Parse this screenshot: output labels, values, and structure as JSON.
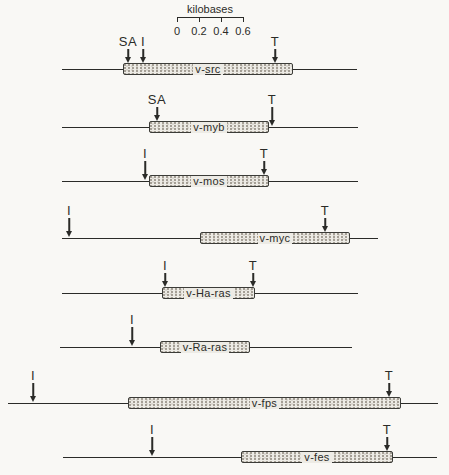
{
  "figure": {
    "colors": {
      "background": "#f9f8f5",
      "ink": "#2b2b28",
      "box_fill": "#edebe5",
      "box_dot": "#a39d93"
    },
    "scale": {
      "title": "kilobases",
      "tick_labels": [
        "0",
        "0.2",
        "0.4",
        "0.6"
      ],
      "x": 177,
      "width": 66,
      "bar_y": 17,
      "title_y": 3,
      "labels_y": 25
    },
    "rows": [
      {
        "label": "v-src",
        "label_parts": {
          "plain": "v-",
          "underlined": "src"
        },
        "line": {
          "x1": 62,
          "x2": 357,
          "y": 69
        },
        "box": {
          "x": 123,
          "w": 170
        },
        "arrows": [
          {
            "label": "SA",
            "x": 128
          },
          {
            "label": "I",
            "x": 143
          },
          {
            "label": "T",
            "x": 275
          }
        ]
      },
      {
        "label": "v-myb",
        "line": {
          "x1": 62,
          "x2": 358,
          "y": 127
        },
        "box": {
          "x": 149,
          "w": 120
        },
        "arrows": [
          {
            "label": "SA",
            "x": 157
          },
          {
            "label": "T",
            "x": 272
          }
        ]
      },
      {
        "label": "v-mos",
        "line": {
          "x1": 62,
          "x2": 358,
          "y": 181
        },
        "box": {
          "x": 149,
          "w": 120
        },
        "arrows": [
          {
            "label": "I",
            "x": 145
          },
          {
            "label": "T",
            "x": 264
          }
        ]
      },
      {
        "label": "v-myc",
        "line": {
          "x1": 62,
          "x2": 378,
          "y": 238
        },
        "box": {
          "x": 200,
          "w": 150
        },
        "arrows": [
          {
            "label": "I",
            "x": 69
          },
          {
            "label": "T",
            "x": 325
          }
        ]
      },
      {
        "label": "v-Ha-ras",
        "line": {
          "x1": 62,
          "x2": 358,
          "y": 293
        },
        "box": {
          "x": 162,
          "w": 93
        },
        "arrows": [
          {
            "label": "I",
            "x": 165
          },
          {
            "label": "T",
            "x": 253
          }
        ]
      },
      {
        "label": "v-Ra-ras",
        "line": {
          "x1": 60,
          "x2": 352,
          "y": 347
        },
        "box": {
          "x": 160,
          "w": 90
        },
        "arrows": [
          {
            "label": "I",
            "x": 132
          }
        ]
      },
      {
        "label": "v-fps",
        "line": {
          "x1": 8,
          "x2": 438,
          "y": 403
        },
        "box": {
          "x": 128,
          "w": 273
        },
        "arrows": [
          {
            "label": "I",
            "x": 33
          },
          {
            "label": "T",
            "x": 389
          }
        ]
      },
      {
        "label": "v-fes",
        "line": {
          "x1": 63,
          "x2": 437,
          "y": 457
        },
        "box": {
          "x": 241,
          "w": 152
        },
        "arrows": [
          {
            "label": "I",
            "x": 152
          },
          {
            "label": "T",
            "x": 387
          }
        ]
      }
    ]
  }
}
